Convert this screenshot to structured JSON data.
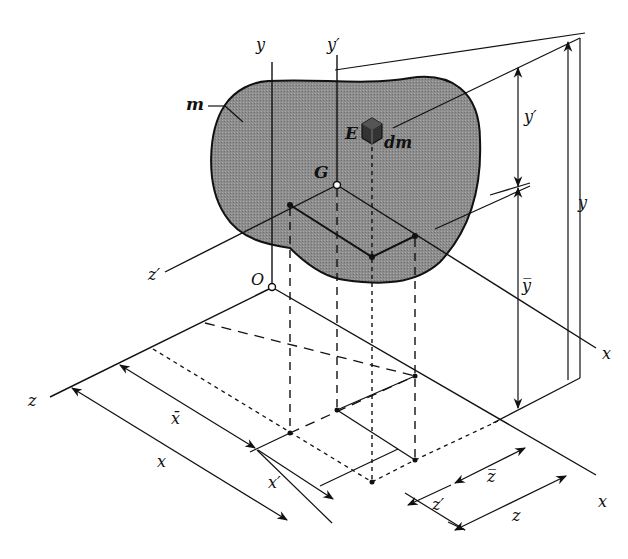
{
  "diagram": {
    "colors": {
      "body_fill": "#8a8a8a",
      "line": "#111111",
      "background": "#ffffff"
    },
    "labels": {
      "mass": "m",
      "element_point": "E",
      "element_mass": "dm",
      "center_of_mass": "G",
      "origin": "O",
      "y_axis": "y",
      "y_prime_axis": "y′",
      "z_prime_axis": "z′",
      "x_axis_upper": "x",
      "x_axis_lower": "x",
      "z_axis": "z",
      "dim_y_prime": "y′",
      "dim_y_bar": "y̅",
      "dim_y": "y",
      "dim_x_bar": "x̄",
      "dim_x": "x",
      "dim_x_prime": "x′",
      "dim_z_bar": "z̅",
      "dim_z_prime": "z′",
      "dim_z": "z"
    }
  }
}
